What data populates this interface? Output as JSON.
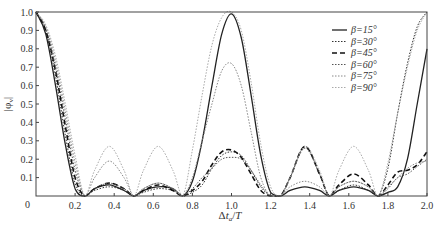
{
  "chart_data": {
    "type": "line",
    "title": "",
    "xlabel": "Δt_a/T",
    "ylabel": "|φ_v|",
    "xlim": [
      0,
      2.0
    ],
    "ylim": [
      0,
      1.0
    ],
    "grid": false,
    "legend_position": "upper right",
    "x_ticks": [
      "0",
      "0.2",
      "0.4",
      "0.6",
      "0.8",
      "1.0",
      "1.2",
      "1.4",
      "1.6",
      "1.8",
      "2.0"
    ],
    "y_ticks": [
      "0",
      "0.1",
      "0.2",
      "0.3",
      "0.4",
      "0.5",
      "0.6",
      "0.7",
      "0.8",
      "0.9",
      "1.0"
    ],
    "x": [
      0,
      0.05,
      0.1,
      0.15,
      0.2,
      0.25,
      0.3,
      0.375,
      0.45,
      0.5,
      0.55,
      0.625,
      0.7,
      0.75,
      0.8,
      0.85,
      0.9,
      0.95,
      1.0,
      1.05,
      1.1,
      1.15,
      1.2,
      1.25,
      1.3,
      1.375,
      1.45,
      1.5,
      1.55,
      1.625,
      1.7,
      1.75,
      1.8,
      1.85,
      1.9,
      1.95,
      2.0
    ],
    "series": [
      {
        "name": "β=15°",
        "style": "solid",
        "color": "#222222",
        "width": 1.3,
        "values": [
          1.0,
          0.88,
          0.6,
          0.28,
          0.04,
          0.0,
          0.04,
          0.06,
          0.03,
          0.0,
          0.03,
          0.05,
          0.04,
          0.0,
          0.08,
          0.3,
          0.6,
          0.88,
          0.99,
          0.86,
          0.55,
          0.22,
          0.02,
          0.0,
          0.03,
          0.05,
          0.03,
          0.0,
          0.03,
          0.05,
          0.03,
          0.0,
          0.02,
          0.05,
          0.2,
          0.5,
          0.8
        ]
      },
      {
        "name": "β=30°",
        "style": "dotted",
        "color": "#333333",
        "width": 1.0,
        "values": [
          1.0,
          0.9,
          0.65,
          0.33,
          0.07,
          0.0,
          0.03,
          0.05,
          0.03,
          0.0,
          0.02,
          0.04,
          0.03,
          0.0,
          0.02,
          0.06,
          0.15,
          0.22,
          0.24,
          0.22,
          0.14,
          0.05,
          0.0,
          0.0,
          0.1,
          0.27,
          0.12,
          0.0,
          0.03,
          0.06,
          0.03,
          0.0,
          0.15,
          0.45,
          0.72,
          0.92,
          1.0
        ]
      },
      {
        "name": "β=45°",
        "style": "dashed",
        "color": "#111111",
        "width": 1.6,
        "values": [
          1.0,
          0.9,
          0.68,
          0.38,
          0.1,
          0.0,
          0.04,
          0.07,
          0.04,
          0.0,
          0.03,
          0.06,
          0.03,
          0.0,
          0.03,
          0.08,
          0.17,
          0.24,
          0.25,
          0.21,
          0.12,
          0.03,
          0.0,
          0.0,
          0.1,
          0.27,
          0.12,
          0.0,
          0.06,
          0.12,
          0.06,
          0.0,
          0.06,
          0.13,
          0.14,
          0.17,
          0.24
        ]
      },
      {
        "name": "β=60°",
        "style": "dotted",
        "color": "#555555",
        "width": 1.0,
        "values": [
          1.0,
          0.91,
          0.7,
          0.42,
          0.14,
          0.0,
          0.04,
          0.07,
          0.04,
          0.0,
          0.04,
          0.07,
          0.04,
          0.0,
          0.04,
          0.1,
          0.15,
          0.2,
          0.21,
          0.2,
          0.14,
          0.06,
          0.0,
          0.0,
          0.1,
          0.26,
          0.12,
          0.0,
          0.05,
          0.08,
          0.05,
          0.0,
          0.04,
          0.1,
          0.12,
          0.16,
          0.2
        ]
      },
      {
        "name": "β=75°",
        "style": "dotted",
        "color": "#888888",
        "width": 1.0,
        "values": [
          1.0,
          0.92,
          0.73,
          0.46,
          0.18,
          0.0,
          0.1,
          0.19,
          0.1,
          0.0,
          0.04,
          0.07,
          0.04,
          0.0,
          0.1,
          0.3,
          0.5,
          0.68,
          0.72,
          0.6,
          0.35,
          0.1,
          0.0,
          0.0,
          0.05,
          0.08,
          0.05,
          0.0,
          0.05,
          0.08,
          0.05,
          0.0,
          0.05,
          0.1,
          0.15,
          0.18,
          0.19
        ]
      },
      {
        "name": "β=90°",
        "style": "dotted",
        "color": "#aaaaaa",
        "width": 1.0,
        "values": [
          1.0,
          0.93,
          0.76,
          0.5,
          0.22,
          0.0,
          0.14,
          0.27,
          0.14,
          0.0,
          0.14,
          0.27,
          0.14,
          0.0,
          0.25,
          0.55,
          0.82,
          0.97,
          1.0,
          0.9,
          0.62,
          0.28,
          0.05,
          0.0,
          0.1,
          0.27,
          0.14,
          0.0,
          0.14,
          0.27,
          0.14,
          0.0,
          0.18,
          0.45,
          0.7,
          0.9,
          1.0
        ]
      }
    ]
  }
}
